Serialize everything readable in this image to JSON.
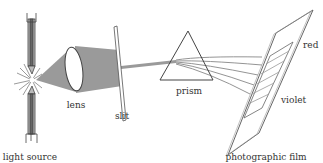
{
  "diagram": {
    "labels": {
      "light_source": "light source",
      "lens": "lens",
      "slit": "slit",
      "prism": "prism",
      "red": "red",
      "violet": "violet",
      "photographic_film": "photographic film"
    },
    "colors": {
      "beam": "#9a9a9a",
      "line": "#555555",
      "text": "#333333",
      "background": "#ffffff"
    }
  }
}
